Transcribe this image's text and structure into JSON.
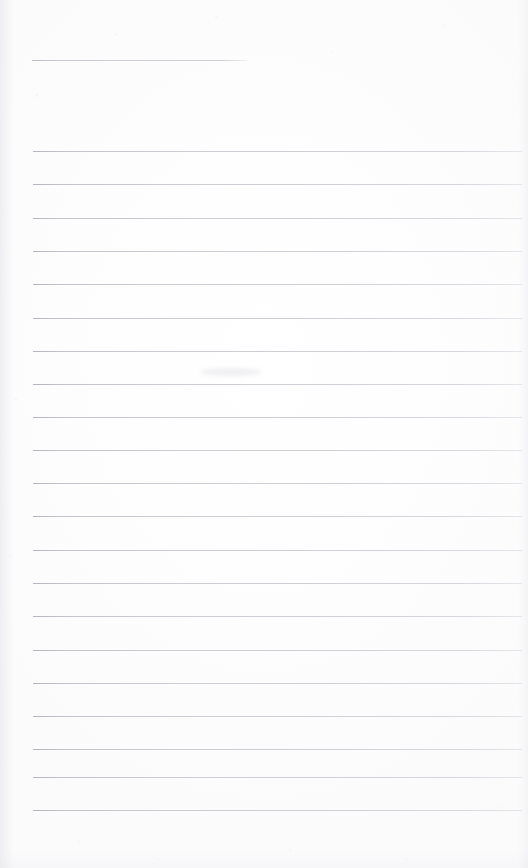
{
  "document": {
    "kind": "scanned-blank-lined-page",
    "title": "Scanned Lined Page",
    "description": "Blank ruled notebook / ledger page with no handwriting or printed text",
    "page_width": 528,
    "page_height": 868,
    "background_color": "#fdfdfe",
    "rule_color": "#c2c2c6",
    "rule_thickness_px": 1,
    "text_content": "",
    "margins": {
      "top_px": 55,
      "left_px": 33,
      "right_px": 6,
      "bottom_px": 55
    },
    "rules": {
      "count": 22,
      "line_spacing_px": 33.3,
      "full_width": {
        "x_start": 33,
        "x_end": 522
      },
      "header_rule": {
        "x_start": 32,
        "x_end": 247,
        "y": 60,
        "label": "short-header-rule"
      },
      "y_positions": [
        60,
        151,
        184,
        218,
        251,
        284,
        318,
        351,
        384,
        417,
        450,
        483,
        516,
        550,
        583,
        616,
        650,
        683,
        716,
        749,
        777,
        810
      ]
    },
    "artifacts": [
      {
        "name": "scan-smudge",
        "x": 200,
        "y": 368,
        "width": 62,
        "height": 8
      }
    ]
  }
}
